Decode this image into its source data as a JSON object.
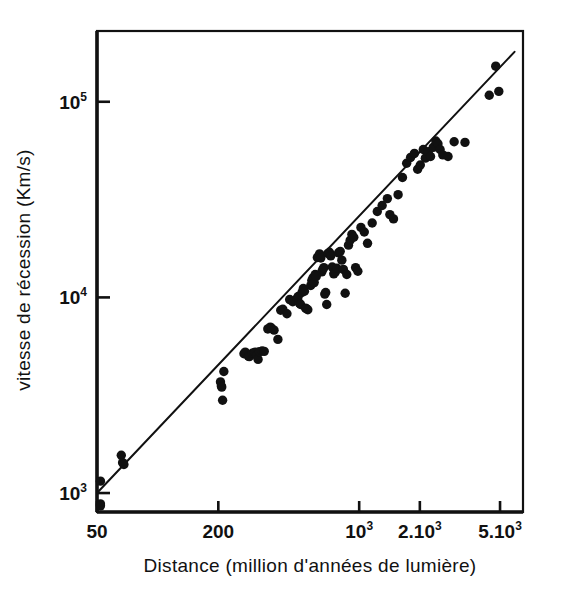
{
  "figure": {
    "background_color": "#ffffff",
    "ink_color": "#111111",
    "frame": {
      "left": 97,
      "top": 31,
      "right": 523,
      "bottom": 512
    }
  },
  "chart_data": {
    "type": "scatter",
    "title": "",
    "subtitle": "",
    "xlabel": "Distance (million d'années de lumière)",
    "ylabel": "vitesse de récession (Km/s)",
    "xscale": "log",
    "yscale": "log",
    "xlim": [
      50,
      6500
    ],
    "ylim": [
      800,
      230000
    ],
    "grid": false,
    "legend": null,
    "annotations": [],
    "xticks": [
      {
        "value": 50,
        "label": "50",
        "exponent": ""
      },
      {
        "value": 200,
        "label": "200",
        "exponent": ""
      },
      {
        "value": 1000,
        "label": "10",
        "exponent": "3"
      },
      {
        "value": 2000,
        "label": "2.10",
        "exponent": "3"
      },
      {
        "value": 5000,
        "label": "5.10",
        "exponent": "3"
      }
    ],
    "yticks": [
      {
        "value": 1000,
        "label": "10",
        "exponent": "3"
      },
      {
        "value": 10000,
        "label": "10",
        "exponent": "4"
      },
      {
        "value": 100000,
        "label": "10",
        "exponent": "5"
      }
    ],
    "series": [
      {
        "name": "galaxies",
        "marker": "filled-circle",
        "marker_size": 7,
        "color": "#111111",
        "points": [
          [
            52,
            1150
          ],
          [
            52,
            880
          ],
          [
            52,
            860
          ],
          [
            66,
            1560
          ],
          [
            67,
            1430
          ],
          [
            68,
            1400
          ],
          [
            205,
            3700
          ],
          [
            207,
            3520
          ],
          [
            208,
            3480
          ],
          [
            210,
            2980
          ],
          [
            213,
            4180
          ],
          [
            268,
            5150
          ],
          [
            272,
            5250
          ],
          [
            282,
            5000
          ],
          [
            285,
            4980
          ],
          [
            295,
            5180
          ],
          [
            300,
            5200
          ],
          [
            305,
            5250
          ],
          [
            310,
            5050
          ],
          [
            315,
            4820
          ],
          [
            320,
            5280
          ],
          [
            330,
            5320
          ],
          [
            338,
            5300
          ],
          [
            352,
            6900
          ],
          [
            362,
            7050
          ],
          [
            368,
            6950
          ],
          [
            378,
            6800
          ],
          [
            395,
            6100
          ],
          [
            408,
            8600
          ],
          [
            418,
            8700
          ],
          [
            438,
            8250
          ],
          [
            452,
            9750
          ],
          [
            468,
            9500
          ],
          [
            492,
            9900
          ],
          [
            498,
            10100
          ],
          [
            505,
            9350
          ],
          [
            512,
            9200
          ],
          [
            520,
            10600
          ],
          [
            528,
            11100
          ],
          [
            535,
            10750
          ],
          [
            542,
            8800
          ],
          [
            548,
            8750
          ],
          [
            556,
            8650
          ],
          [
            575,
            11500
          ],
          [
            582,
            12200
          ],
          [
            590,
            12600
          ],
          [
            598,
            11900
          ],
          [
            605,
            13100
          ],
          [
            612,
            12800
          ],
          [
            620,
            16000
          ],
          [
            628,
            16200
          ],
          [
            636,
            16700
          ],
          [
            645,
            15900
          ],
          [
            652,
            13500
          ],
          [
            660,
            13900
          ],
          [
            668,
            14200
          ],
          [
            675,
            10400
          ],
          [
            682,
            10600
          ],
          [
            690,
            9200
          ],
          [
            700,
            16800
          ],
          [
            712,
            17000
          ],
          [
            722,
            16300
          ],
          [
            735,
            14300
          ],
          [
            748,
            13200
          ],
          [
            762,
            13500
          ],
          [
            775,
            14100
          ],
          [
            790,
            16900
          ],
          [
            805,
            17200
          ],
          [
            820,
            15500
          ],
          [
            835,
            13900
          ],
          [
            852,
            10500
          ],
          [
            868,
            13100
          ],
          [
            885,
            18500
          ],
          [
            902,
            19600
          ],
          [
            920,
            21000
          ],
          [
            940,
            20300
          ],
          [
            960,
            14200
          ],
          [
            985,
            13600
          ],
          [
            1020,
            22800
          ],
          [
            1060,
            21600
          ],
          [
            1100,
            18900
          ],
          [
            1160,
            24000
          ],
          [
            1230,
            27500
          ],
          [
            1300,
            29500
          ],
          [
            1380,
            32000
          ],
          [
            1420,
            26500
          ],
          [
            1480,
            25200
          ],
          [
            1560,
            33500
          ],
          [
            1640,
            41000
          ],
          [
            1720,
            48500
          ],
          [
            1800,
            52000
          ],
          [
            1880,
            54500
          ],
          [
            1950,
            45200
          ],
          [
            2010,
            47500
          ],
          [
            2080,
            57000
          ],
          [
            2130,
            51500
          ],
          [
            2200,
            55500
          ],
          [
            2260,
            52500
          ],
          [
            2330,
            58500
          ],
          [
            2400,
            63000
          ],
          [
            2460,
            61000
          ],
          [
            2520,
            57000
          ],
          [
            2600,
            53500
          ],
          [
            2760,
            52500
          ],
          [
            2960,
            62500
          ],
          [
            3350,
            62000
          ],
          [
            4420,
            108000
          ],
          [
            4760,
            152000
          ],
          [
            4930,
            113000
          ]
        ]
      }
    ],
    "fit_line": {
      "name": "Hubble law fit",
      "color": "#111111",
      "width": 2,
      "x_start": 50,
      "y_start": 1000,
      "x_end": 5900,
      "y_end": 180000
    }
  }
}
